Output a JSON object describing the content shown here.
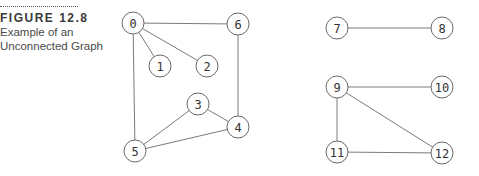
{
  "caption": {
    "figure_label": "FIGURE 12.8",
    "description_line1": "Example of an",
    "description_line2": "Unconnected Graph"
  },
  "graph": {
    "nodes": [
      "0",
      "1",
      "2",
      "3",
      "4",
      "5",
      "6",
      "7",
      "8",
      "9",
      "10",
      "11",
      "12"
    ],
    "edges": [
      [
        "0",
        "6"
      ],
      [
        "0",
        "1"
      ],
      [
        "0",
        "2"
      ],
      [
        "0",
        "5"
      ],
      [
        "6",
        "4"
      ],
      [
        "3",
        "4"
      ],
      [
        "3",
        "5"
      ],
      [
        "5",
        "4"
      ],
      [
        "7",
        "8"
      ],
      [
        "9",
        "10"
      ],
      [
        "9",
        "11"
      ],
      [
        "9",
        "12"
      ],
      [
        "11",
        "12"
      ]
    ],
    "components": [
      [
        "0",
        "1",
        "2",
        "3",
        "4",
        "5",
        "6"
      ],
      [
        "7",
        "8"
      ],
      [
        "9",
        "10",
        "11",
        "12"
      ]
    ]
  }
}
